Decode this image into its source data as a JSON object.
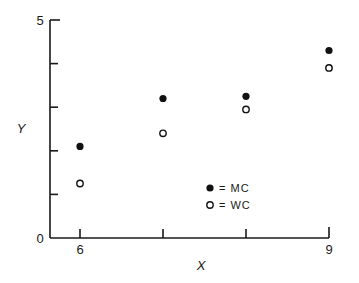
{
  "chart_data": {
    "type": "scatter",
    "title": "",
    "xlabel": "X",
    "ylabel": "Y",
    "xlim": [
      6,
      9
    ],
    "ylim": [
      0,
      5
    ],
    "x_tick_labels": [
      "6",
      "",
      "",
      "9"
    ],
    "x_ticks": [
      6,
      7,
      8,
      9
    ],
    "y_tick_labels": [
      "0",
      "",
      "",
      "",
      "",
      "5"
    ],
    "y_ticks": [
      0,
      1,
      2,
      3,
      4,
      5
    ],
    "grid": false,
    "legend_position": "lower-right inside",
    "series": [
      {
        "name": "MC",
        "marker": "filled-circle",
        "x": [
          6,
          7,
          8,
          9
        ],
        "y": [
          2.1,
          3.2,
          3.25,
          4.3
        ]
      },
      {
        "name": "WC",
        "marker": "open-circle",
        "x": [
          6,
          7,
          8,
          9
        ],
        "y": [
          1.25,
          2.4,
          2.95,
          3.9
        ]
      }
    ]
  },
  "legend": {
    "mc_label": "= MC",
    "wc_label": "= WC"
  },
  "axes": {
    "x_label": "X",
    "y_label": "Y",
    "y_min_label": "0",
    "y_max_label": "5",
    "x_min_label": "6",
    "x_max_label": "9"
  }
}
